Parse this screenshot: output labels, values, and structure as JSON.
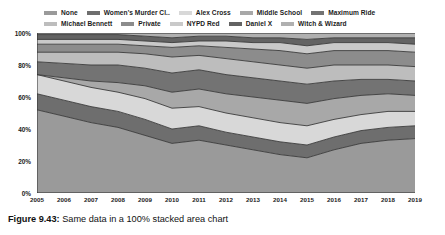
{
  "caption": {
    "label": "Figure 9.43:",
    "text": "Same data in a 100% stacked area chart"
  },
  "chart_data": {
    "type": "area",
    "stacked": "100%",
    "title": "",
    "xlabel": "",
    "ylabel": "",
    "ylim": [
      0,
      100
    ],
    "ytick_labels": [
      "0%",
      "20%",
      "40%",
      "60%",
      "80%",
      "100%"
    ],
    "ytick_values": [
      0,
      20,
      40,
      60,
      80,
      100
    ],
    "grid": false,
    "legend_position": "top",
    "categories": [
      "2005",
      "2006",
      "2007",
      "2008",
      "2009",
      "2010",
      "2011",
      "2012",
      "2013",
      "2014",
      "2015",
      "2016",
      "2017",
      "2018",
      "2019"
    ],
    "series": [
      {
        "name": "None",
        "color": "#9a9a9a",
        "values": [
          52,
          48,
          44,
          41,
          36,
          31,
          33,
          30,
          27,
          24,
          22,
          27,
          31,
          33,
          34
        ]
      },
      {
        "name": "Women's Murder Cl..",
        "color": "#6e6e6e",
        "values": [
          10,
          10,
          10,
          10,
          10,
          9,
          9,
          8,
          8,
          8,
          8,
          8,
          8,
          8,
          8
        ]
      },
      {
        "name": "Alex Cross",
        "color": "#d8d8d8",
        "values": [
          12,
          12,
          12,
          12,
          13,
          13,
          12,
          12,
          12,
          12,
          12,
          11,
          10,
          10,
          9
        ]
      },
      {
        "name": "Middle School",
        "color": "#a8a8a8",
        "values": [
          0,
          2,
          4,
          6,
          8,
          10,
          11,
          12,
          13,
          14,
          14,
          13,
          12,
          11,
          10
        ]
      },
      {
        "name": "Maximum Ride",
        "color": "#737373",
        "values": [
          8,
          9,
          10,
          11,
          11,
          12,
          12,
          12,
          12,
          12,
          12,
          11,
          10,
          9,
          9
        ]
      },
      {
        "name": "Michael Bennett",
        "color": "#bdbdbd",
        "values": [
          6,
          7,
          8,
          8,
          9,
          10,
          9,
          10,
          10,
          10,
          10,
          10,
          9,
          9,
          9
        ]
      },
      {
        "name": "Private",
        "color": "#8c8c8c",
        "values": [
          5,
          5,
          5,
          5,
          5,
          6,
          6,
          7,
          8,
          9,
          9,
          9,
          9,
          9,
          9
        ]
      },
      {
        "name": "NYPD Red",
        "color": "#c9c9c9",
        "values": [
          3,
          3,
          3,
          3,
          3,
          3,
          3,
          4,
          4,
          5,
          5,
          5,
          5,
          5,
          5
        ]
      },
      {
        "name": "Daniel X",
        "color": "#636363",
        "values": [
          3,
          3,
          3,
          3,
          3,
          3,
          3,
          3,
          3,
          3,
          4,
          3,
          3,
          3,
          4
        ]
      },
      {
        "name": "Witch & Wizard",
        "color": "#b0b0b0",
        "values": [
          1,
          1,
          1,
          1,
          2,
          3,
          2,
          2,
          3,
          3,
          4,
          3,
          3,
          3,
          3
        ]
      }
    ]
  }
}
